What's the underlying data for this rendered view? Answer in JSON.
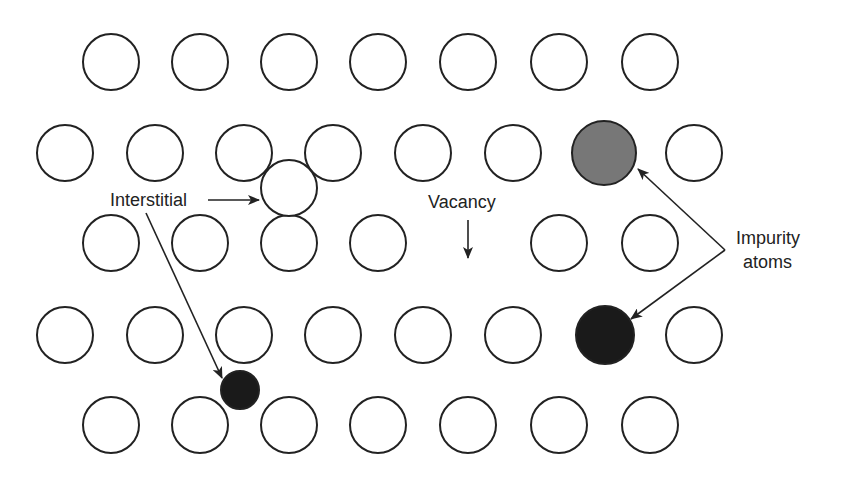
{
  "diagram": {
    "colors": {
      "atom_stroke": "#222222",
      "atom_fill": "#ffffff",
      "impurity_gray": "#777777",
      "impurity_black": "#1a1a1a",
      "arrow": "#222222",
      "text": "#222222"
    },
    "atom_radius": 28,
    "lattice_atoms": [
      {
        "row": 1,
        "x": 111,
        "y": 62
      },
      {
        "row": 1,
        "x": 200,
        "y": 62
      },
      {
        "row": 1,
        "x": 289,
        "y": 62
      },
      {
        "row": 1,
        "x": 378,
        "y": 62
      },
      {
        "row": 1,
        "x": 468,
        "y": 62
      },
      {
        "row": 1,
        "x": 559,
        "y": 62
      },
      {
        "row": 1,
        "x": 650,
        "y": 62
      },
      {
        "row": 2,
        "x": 65,
        "y": 153
      },
      {
        "row": 2,
        "x": 155,
        "y": 153
      },
      {
        "row": 2,
        "x": 244,
        "y": 153
      },
      {
        "row": 2,
        "x": 333,
        "y": 153
      },
      {
        "row": 2,
        "x": 423,
        "y": 153
      },
      {
        "row": 2,
        "x": 513,
        "y": 153
      },
      {
        "row": 2,
        "x": 694,
        "y": 153
      },
      {
        "row": 3,
        "x": 111,
        "y": 243
      },
      {
        "row": 3,
        "x": 200,
        "y": 243
      },
      {
        "row": 3,
        "x": 289,
        "y": 243
      },
      {
        "row": 3,
        "x": 378,
        "y": 243
      },
      {
        "row": 3,
        "x": 559,
        "y": 243
      },
      {
        "row": 3,
        "x": 650,
        "y": 243
      },
      {
        "row": 4,
        "x": 65,
        "y": 335
      },
      {
        "row": 4,
        "x": 155,
        "y": 335
      },
      {
        "row": 4,
        "x": 244,
        "y": 335
      },
      {
        "row": 4,
        "x": 333,
        "y": 335
      },
      {
        "row": 4,
        "x": 423,
        "y": 335
      },
      {
        "row": 4,
        "x": 513,
        "y": 335
      },
      {
        "row": 4,
        "x": 694,
        "y": 335
      },
      {
        "row": 5,
        "x": 111,
        "y": 425
      },
      {
        "row": 5,
        "x": 200,
        "y": 425
      },
      {
        "row": 5,
        "x": 289,
        "y": 425
      },
      {
        "row": 5,
        "x": 378,
        "y": 425
      },
      {
        "row": 5,
        "x": 468,
        "y": 425
      },
      {
        "row": 5,
        "x": 559,
        "y": 425
      },
      {
        "row": 5,
        "x": 650,
        "y": 425
      }
    ],
    "defects": {
      "self_interstitial": {
        "x": 289,
        "y": 188,
        "r": 28,
        "fill": "#ffffff"
      },
      "small_interstitial_impurity": {
        "x": 240,
        "y": 390,
        "r": 19,
        "fill": "#1a1a1a"
      },
      "substitutional_gray": {
        "x": 604,
        "y": 153,
        "r": 32,
        "fill": "#777777"
      },
      "substitutional_black": {
        "x": 605,
        "y": 335,
        "r": 29,
        "fill": "#1a1a1a"
      },
      "vacancy_site": {
        "x": 468,
        "y": 243
      }
    },
    "labels": {
      "interstitial": {
        "text": "Interstitial",
        "x": 110,
        "y": 190
      },
      "vacancy": {
        "text": "Vacancy",
        "x": 428,
        "y": 192
      },
      "impurity_line1": {
        "text": "Impurity",
        "x": 736,
        "y": 228
      },
      "impurity_line2": {
        "text": "atoms",
        "x": 743,
        "y": 252
      }
    },
    "arrows": [
      {
        "name": "interstitial-to-self-interstitial",
        "x1": 208,
        "y1": 200,
        "x2": 259,
        "y2": 200
      },
      {
        "name": "interstitial-to-small-atom",
        "x1": 146,
        "y1": 213,
        "x2": 222,
        "y2": 378
      },
      {
        "name": "vacancy-down",
        "x1": 468,
        "y1": 220,
        "x2": 468,
        "y2": 258
      },
      {
        "name": "impurity-to-gray",
        "x1": 725,
        "y1": 250,
        "x2": 638,
        "y2": 169
      },
      {
        "name": "impurity-to-black",
        "x1": 725,
        "y1": 250,
        "x2": 631,
        "y2": 319
      }
    ]
  }
}
